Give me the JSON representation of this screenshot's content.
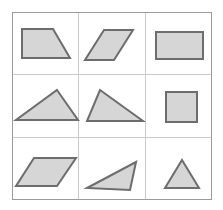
{
  "figure": {
    "background_color": "#ffffff",
    "border_color": "#9a9a9a",
    "grid_line_color": "#c9c9c9",
    "shape_fill_color": "#d6d6d6",
    "shape_stroke_color": "#6d6d6d",
    "shape_stroke_width": 2,
    "rows": 3,
    "columns": 3,
    "frame": {
      "x": 12,
      "y": 12,
      "width": 200,
      "height": 188
    },
    "grid_lines": {
      "vertical": [
        78.5,
        145.5
      ],
      "horizontal": [
        74.5,
        137.5
      ]
    }
  },
  "cells": [
    {
      "index": 1,
      "row": 1,
      "column": 1,
      "shape_name": "right-trapezoid",
      "label": "Right trapezoid",
      "sides": 4,
      "points": "22,29 53,29 70,58 22,58"
    },
    {
      "index": 2,
      "row": 1,
      "column": 2,
      "shape_name": "parallelogram-steep",
      "label": "Parallelogram",
      "sides": 4,
      "points": "104,30 133,30 114,60 85,60"
    },
    {
      "index": 3,
      "row": 1,
      "column": 3,
      "shape_name": "rectangle-wide",
      "label": "Rectangle",
      "sides": 4,
      "points": "156,32 203,32 203,59 156,59"
    },
    {
      "index": 4,
      "row": 2,
      "column": 1,
      "shape_name": "triangle-isosceles-wide",
      "label": "Wide triangle",
      "sides": 3,
      "points": "57,90 78,120 16,120"
    },
    {
      "index": 5,
      "row": 2,
      "column": 2,
      "shape_name": "triangle-scalene-left-apex",
      "label": "Scalene triangle",
      "sides": 3,
      "points": "100,90 143,121 87,121"
    },
    {
      "index": 6,
      "row": 2,
      "column": 3,
      "shape_name": "square",
      "label": "Square",
      "sides": 4,
      "points": "166,92 197,92 197,122 166,122"
    },
    {
      "index": 7,
      "row": 3,
      "column": 1,
      "shape_name": "parallelogram-flat",
      "label": "Flat parallelogram",
      "sides": 4,
      "points": "34,158 76,158 57,186 16,186"
    },
    {
      "index": 8,
      "row": 3,
      "column": 2,
      "shape_name": "triangle-scalene-thin",
      "label": "Thin scalene triangle",
      "sides": 3,
      "points": "136,162 130,190 87,188"
    },
    {
      "index": 9,
      "row": 3,
      "column": 3,
      "shape_name": "triangle-isosceles-small",
      "label": "Small triangle",
      "sides": 3,
      "points": "182,160 199,188 165,188"
    }
  ]
}
